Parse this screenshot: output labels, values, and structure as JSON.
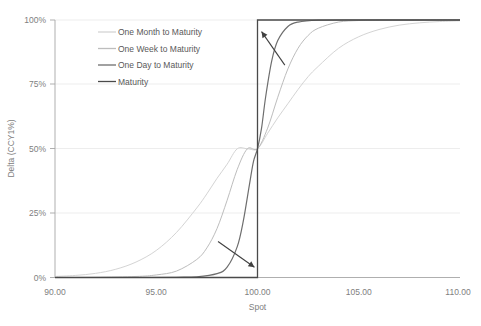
{
  "chart_data": {
    "type": "line",
    "title": "",
    "xlabel": "Spot",
    "ylabel": "Delta (CCY1%)",
    "xlim": [
      90,
      110
    ],
    "ylim": [
      0,
      100
    ],
    "grid": true,
    "legend_position": "top-center-inside",
    "x_ticks": [
      "90.00",
      "95.00",
      "100.00",
      "105.00",
      "110.00"
    ],
    "x_tick_values": [
      90,
      95,
      100,
      105,
      110
    ],
    "y_ticks": [
      "0%",
      "25%",
      "50%",
      "75%",
      "100%"
    ],
    "y_tick_values": [
      0,
      25,
      50,
      75,
      100
    ],
    "series": [
      {
        "name": "One Month to Maturity",
        "color": "#d4d4d4",
        "width": 1.0,
        "x": [
          90,
          91,
          92,
          93,
          94,
          95,
          96,
          97,
          97.5,
          98,
          98.5,
          99,
          99.5,
          100,
          100.5,
          101,
          101.5,
          102,
          102.5,
          103,
          104,
          105,
          106,
          107,
          108,
          109,
          110
        ],
        "values": [
          0.4,
          0.8,
          1.6,
          3.2,
          6.0,
          10.5,
          17.5,
          27.0,
          32.5,
          38.5,
          44.0,
          50.0,
          50.0,
          50.0,
          56.0,
          62.0,
          67.5,
          73.0,
          78.0,
          82.0,
          89.0,
          93.5,
          96.3,
          98.0,
          98.9,
          99.4,
          99.7
        ]
      },
      {
        "name": "One Week to Maturity",
        "color": "#bdbdbd",
        "width": 1.0,
        "x": [
          90,
          92,
          94,
          95,
          96,
          97,
          97.5,
          98,
          98.5,
          99,
          99.5,
          100,
          100.5,
          101,
          101.5,
          102,
          102.5,
          103,
          104,
          105,
          106,
          108,
          110
        ],
        "values": [
          0.0,
          0.1,
          0.4,
          1.0,
          2.5,
          7.0,
          11.5,
          19.0,
          30.0,
          42.0,
          50.0,
          50.0,
          58.0,
          70.0,
          81.0,
          89.0,
          94.0,
          96.8,
          99.2,
          99.8,
          99.95,
          100.0,
          100.0
        ]
      },
      {
        "name": "One Day to Maturity",
        "color": "#6e6e6e",
        "width": 1.2,
        "x": [
          90,
          94,
          96,
          97,
          98,
          98.5,
          99,
          99.3,
          99.6,
          99.8,
          100,
          100.2,
          100.4,
          100.7,
          101,
          101.5,
          102,
          103,
          105,
          107,
          110
        ],
        "values": [
          0.0,
          0.0,
          0.1,
          0.3,
          1.5,
          4.0,
          12.0,
          22.0,
          36.0,
          45.0,
          50.0,
          58.0,
          70.0,
          84.0,
          92.0,
          97.5,
          99.2,
          99.9,
          100.0,
          100.0,
          100.0
        ]
      },
      {
        "name": "Maturity",
        "color": "#4a4a4a",
        "width": 1.3,
        "step": true,
        "x": [
          90,
          100,
          100,
          110
        ],
        "values": [
          0,
          0,
          100,
          100
        ]
      }
    ],
    "annotations": [
      {
        "name": "upper-convergence-arrow",
        "from": [
          101.35,
          82.5
        ],
        "to": [
          100.2,
          95.5
        ],
        "note": "arrow pointing up-left toward convergence of curves above 50% delta"
      },
      {
        "name": "lower-convergence-arrow",
        "from": [
          98.05,
          14.0
        ],
        "to": [
          99.85,
          4.0
        ],
        "note": "arrow pointing down-right toward convergence of curves below 50% delta"
      }
    ]
  },
  "axis": {
    "y_title": "Delta (CCY1%)",
    "x_title": "Spot"
  },
  "legend": {
    "items": [
      {
        "label": "One Month to Maturity",
        "color": "#d4d4d4"
      },
      {
        "label": "One Week to Maturity",
        "color": "#bdbdbd"
      },
      {
        "label": "One Day to Maturity",
        "color": "#6e6e6e"
      },
      {
        "label": "Maturity",
        "color": "#4a4a4a"
      }
    ]
  }
}
